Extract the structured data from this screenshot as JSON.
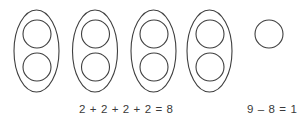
{
  "worksheet": {
    "title": "Grouping by twos with a leftover",
    "stroke_color": "#3f3f3f",
    "text_color": "#3a3a3a",
    "background_color": "#ffffff"
  },
  "groups": [
    {
      "name": "group-1",
      "label": "group of 2",
      "count": 2,
      "ellipse": {
        "cx": 36.5,
        "cy": 51,
        "rx": 22.5,
        "ry": 41
      },
      "circles": [
        {
          "cx": 37,
          "cy": 34,
          "r": 14
        },
        {
          "cx": 37,
          "cy": 67,
          "r": 14
        }
      ]
    },
    {
      "name": "group-2",
      "label": "group of 2",
      "count": 2,
      "ellipse": {
        "cx": 95,
        "cy": 51,
        "rx": 22.5,
        "ry": 41
      },
      "circles": [
        {
          "cx": 95.5,
          "cy": 34,
          "r": 14
        },
        {
          "cx": 95.5,
          "cy": 67,
          "r": 14
        }
      ]
    },
    {
      "name": "group-3",
      "label": "group of 2",
      "count": 2,
      "ellipse": {
        "cx": 153.5,
        "cy": 51,
        "rx": 22.5,
        "ry": 41
      },
      "circles": [
        {
          "cx": 154,
          "cy": 34,
          "r": 14
        },
        {
          "cx": 154,
          "cy": 67,
          "r": 14
        }
      ]
    },
    {
      "name": "group-4",
      "label": "group of 2",
      "count": 2,
      "ellipse": {
        "cx": 209.5,
        "cy": 51,
        "rx": 22.5,
        "ry": 41
      },
      "circles": [
        {
          "cx": 210,
          "cy": 34,
          "r": 14
        },
        {
          "cx": 210,
          "cy": 67,
          "r": 14
        }
      ]
    }
  ],
  "leftover": {
    "name": "leftover-circle",
    "label": "leftover 1",
    "count": 1,
    "circle": {
      "cx": 269,
      "cy": 34,
      "r": 14
    }
  },
  "equations": {
    "addition": "2 + 2 + 2 + 2 = 8",
    "subtraction": "9 – 8 = 1"
  },
  "totals": {
    "grouped": 8,
    "leftover": 1,
    "all": 9
  }
}
